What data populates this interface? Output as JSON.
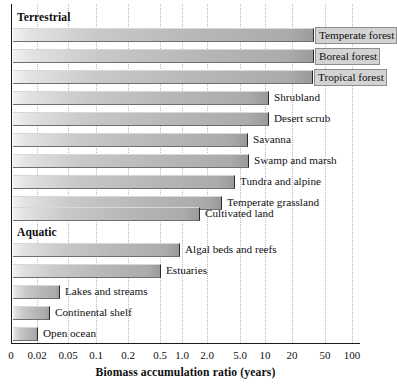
{
  "chart_data": {
    "type": "bar",
    "orientation": "horizontal",
    "title": "",
    "xlabel": "Biomass accumulation ratio (years)",
    "ylabel": "",
    "xscale": "log",
    "xlim": [
      0,
      100
    ],
    "grid": "vertical-dotted",
    "legend": "none",
    "axis_ticks": [
      {
        "label": "0",
        "x_px": 11
      },
      {
        "label": "0.02",
        "x_px": 37
      },
      {
        "label": "0.05",
        "x_px": 68
      },
      {
        "label": "0.1",
        "x_px": 96
      },
      {
        "label": "0.2",
        "x_px": 128
      },
      {
        "label": "0.5",
        "x_px": 160
      },
      {
        "label": "1.0",
        "x_px": 182
      },
      {
        "label": "2.0",
        "x_px": 207
      },
      {
        "label": "5.0",
        "x_px": 240
      },
      {
        "label": "10",
        "x_px": 265
      },
      {
        "label": "20",
        "x_px": 292
      },
      {
        "label": "50",
        "x_px": 325
      },
      {
        "label": "100",
        "x_px": 352
      }
    ],
    "groups": [
      {
        "name": "Terrestrial",
        "heading_y_px": 11,
        "categories": [
          "Temperate forest",
          "Boreal forest",
          "Tropical forest",
          "Shrubland",
          "Desert scrub",
          "Savanna",
          "Swamp and marsh",
          "Tundra and alpine",
          "Temperate grassland",
          "Cultivated land"
        ],
        "values": [
          40,
          40,
          40,
          12,
          12,
          5,
          5,
          3.2,
          1.8,
          0.9
        ],
        "bar_end_px": [
          314,
          314,
          313,
          269,
          269,
          248,
          249,
          235,
          222,
          200
        ],
        "bar_y_px": [
          28,
          49,
          70,
          91,
          112,
          133,
          154,
          175,
          196,
          207
        ]
      },
      {
        "name": "Aquatic",
        "heading_y_px": 226,
        "categories": [
          "Algal beds and reefs",
          "Estuaries",
          "Lakes and streams",
          "Continental shelf",
          "Open ocean"
        ],
        "values": [
          0.65,
          0.5,
          0.035,
          0.028,
          0.019
        ],
        "bar_end_px": [
          180,
          161,
          60,
          50,
          38
        ],
        "bar_y_px": [
          243,
          264,
          285,
          306,
          327
        ]
      }
    ],
    "rows": [
      {
        "label": "Temperate forest",
        "value": 40,
        "bar_end_px": 314,
        "y_px": 28,
        "label_on_bar": true
      },
      {
        "label": "Boreal forest",
        "value": 40,
        "bar_end_px": 314,
        "y_px": 49,
        "label_on_bar": true
      },
      {
        "label": "Tropical forest",
        "value": 40,
        "bar_end_px": 313,
        "y_px": 70,
        "label_on_bar": true
      },
      {
        "label": "Shrubland",
        "value": 12,
        "bar_end_px": 269,
        "y_px": 91,
        "label_on_bar": false
      },
      {
        "label": "Desert scrub",
        "value": 12,
        "bar_end_px": 269,
        "y_px": 112,
        "label_on_bar": false
      },
      {
        "label": "Savanna",
        "value": 5,
        "bar_end_px": 248,
        "y_px": 133,
        "label_on_bar": false
      },
      {
        "label": "Swamp and marsh",
        "value": 5,
        "bar_end_px": 249,
        "y_px": 154,
        "label_on_bar": false
      },
      {
        "label": "Tundra and alpine",
        "value": 3.2,
        "bar_end_px": 235,
        "y_px": 175,
        "label_on_bar": false
      },
      {
        "label": "Temperate grassland",
        "value": 1.8,
        "bar_end_px": 222,
        "y_px": 196,
        "label_on_bar": false
      },
      {
        "label": "Cultivated land",
        "value": 0.9,
        "bar_end_px": 200,
        "y_px": 207,
        "label_on_bar": false
      },
      {
        "label": "Algal beds and reefs",
        "value": 0.65,
        "bar_end_px": 180,
        "y_px": 243,
        "label_on_bar": false
      },
      {
        "label": "Estuaries",
        "value": 0.5,
        "bar_end_px": 161,
        "y_px": 264,
        "label_on_bar": false
      },
      {
        "label": "Lakes and streams",
        "value": 0.035,
        "bar_end_px": 60,
        "y_px": 285,
        "label_on_bar": false
      },
      {
        "label": "Continental shelf",
        "value": 0.028,
        "bar_end_px": 50,
        "y_px": 306,
        "label_on_bar": false
      },
      {
        "label": "Open ocean",
        "value": 0.019,
        "bar_end_px": 38,
        "y_px": 327,
        "label_on_bar": false
      }
    ]
  },
  "colors": {
    "bar_light": "#f2f2f2",
    "bar_mid": "#c9c9c9",
    "bar_dark": "#9a9a9a",
    "bar_edge": "#2a2a2a",
    "axis": "#1b1b1b",
    "gridline": "#b9b9b9",
    "text": "#101010",
    "background": "#ffffff"
  }
}
